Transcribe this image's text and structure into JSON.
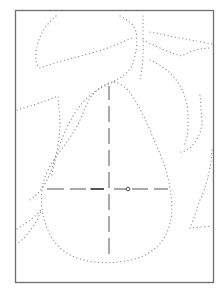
{
  "figure": {
    "frame": {
      "x": 15,
      "y": 10,
      "width": 199,
      "height": 273
    },
    "colors": {
      "dots": "#8a8a8a",
      "frame": "#6e6e6e",
      "center_lines": "#555555",
      "background": "#ffffff"
    },
    "center_marker": {
      "x": 128,
      "y": 189
    }
  }
}
